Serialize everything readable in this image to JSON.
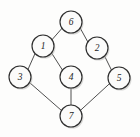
{
  "figure": {
    "kind": "undirected-graph-diagram",
    "width": 140,
    "height": 137,
    "background_color": "#fdfdfc",
    "node_fill_color": "#fbfbfa",
    "node_stroke_color": "#2e2e2e",
    "edge_color": "#3b3b3b",
    "label_color": "#1d1d1d",
    "node_radius": 11,
    "node_count": 7,
    "edge_count": 8
  },
  "nodes": [
    {
      "id": "1",
      "label": "1",
      "cx": 43,
      "cy": 46
    },
    {
      "id": "2",
      "label": "2",
      "cx": 97,
      "cy": 48
    },
    {
      "id": "3",
      "label": "3",
      "cx": 20,
      "cy": 77
    },
    {
      "id": "4",
      "label": "4",
      "cx": 71,
      "cy": 77
    },
    {
      "id": "5",
      "label": "5",
      "cx": 119,
      "cy": 78
    },
    {
      "id": "6",
      "label": "6",
      "cx": 71,
      "cy": 22
    },
    {
      "id": "7",
      "label": "7",
      "cx": 71,
      "cy": 116
    }
  ],
  "edges": [
    {
      "from": "6",
      "to": "1",
      "x1": 62.0,
      "y1": 28.3,
      "x2": 52.0,
      "y2": 39.7
    },
    {
      "from": "6",
      "to": "2",
      "x1": 80.2,
      "y1": 28.1,
      "x2": 87.8,
      "y2": 41.9
    },
    {
      "from": "1",
      "to": "3",
      "x1": 35.0,
      "y1": 53.6,
      "x2": 28.0,
      "y2": 69.4
    },
    {
      "from": "1",
      "to": "4",
      "x1": 51.7,
      "y1": 53.2,
      "x2": 62.3,
      "y2": 69.8
    },
    {
      "from": "2",
      "to": "5",
      "x1": 104.6,
      "y1": 56.1,
      "x2": 111.4,
      "y2": 69.9
    },
    {
      "from": "3",
      "to": "7",
      "x1": 29.6,
      "y1": 82.6,
      "x2": 61.4,
      "y2": 110.4
    },
    {
      "from": "4",
      "to": "7",
      "x1": 71.0,
      "y1": 88.0,
      "x2": 71.0,
      "y2": 105.0
    },
    {
      "from": "5",
      "to": "7",
      "x1": 109.5,
      "y1": 83.7,
      "x2": 80.5,
      "y2": 110.3
    }
  ],
  "chart_data": {
    "type": "diagram",
    "title": "",
    "graph_type": "undirected",
    "vertices": [
      "1",
      "2",
      "3",
      "4",
      "5",
      "6",
      "7"
    ],
    "edge_list": [
      [
        "6",
        "1"
      ],
      [
        "6",
        "2"
      ],
      [
        "1",
        "3"
      ],
      [
        "1",
        "4"
      ],
      [
        "2",
        "5"
      ],
      [
        "3",
        "7"
      ],
      [
        "4",
        "7"
      ],
      [
        "5",
        "7"
      ]
    ],
    "degrees": {
      "1": 3,
      "2": 2,
      "3": 2,
      "4": 2,
      "5": 2,
      "6": 2,
      "7": 3
    }
  }
}
